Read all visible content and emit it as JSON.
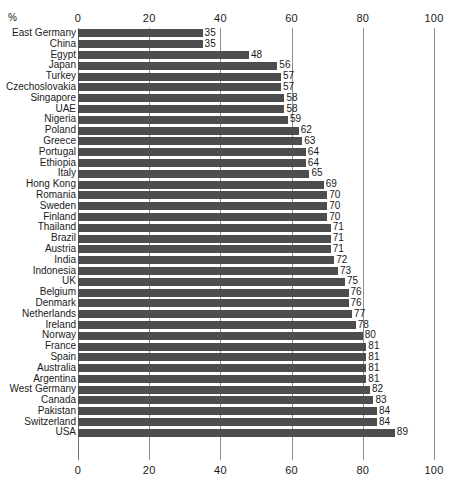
{
  "chart_data": {
    "type": "bar",
    "orientation": "horizontal",
    "title": "",
    "subtitle": "",
    "xlabel": "%",
    "ylabel": "",
    "unit_label": "%",
    "xlim": [
      0,
      100
    ],
    "xticks": [
      0,
      20,
      40,
      60,
      80,
      100
    ],
    "xtick_labels": [
      "0",
      "20",
      "40",
      "60",
      "80",
      "100"
    ],
    "grid": true,
    "grid_axis": "x",
    "legend": false,
    "axis_positions": [
      "top",
      "bottom"
    ],
    "value_labels": true,
    "bar_color": "#4d4d4d",
    "categories": [
      "East Germany",
      "China",
      "Egypt",
      "Japan",
      "Turkey",
      "Czechoslovakia",
      "Singapore",
      "UAE",
      "Nigeria",
      "Poland",
      "Greece",
      "Portugal",
      "Ethiopia",
      "Italy",
      "Hong Kong",
      "Romania",
      "Sweden",
      "Finland",
      "Thailand",
      "Brazil",
      "Austria",
      "India",
      "Indonesia",
      "UK",
      "Belgium",
      "Denmark",
      "Netherlands",
      "Ireland",
      "Norway",
      "France",
      "Spain",
      "Australia",
      "Argentina",
      "West Germany",
      "Canada",
      "Pakistan",
      "Switzerland",
      "USA"
    ],
    "values": [
      35,
      35,
      48,
      56,
      57,
      57,
      58,
      58,
      59,
      62,
      63,
      64,
      64,
      65,
      69,
      70,
      70,
      70,
      71,
      71,
      71,
      72,
      73,
      75,
      76,
      76,
      77,
      78,
      80,
      81,
      81,
      81,
      81,
      82,
      83,
      84,
      84,
      89
    ]
  }
}
